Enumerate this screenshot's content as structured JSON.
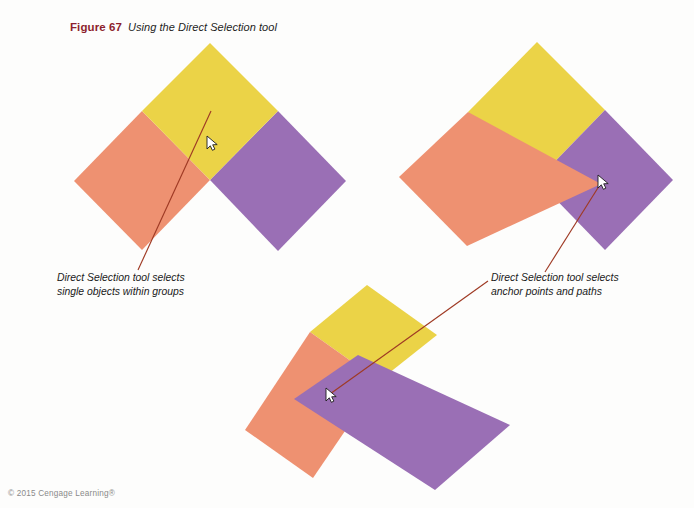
{
  "page": {
    "background_color": "#fdfdfc",
    "width": 694,
    "height": 508
  },
  "caption": {
    "figure_label": "Figure 67",
    "figure_title": "Using the Direct Selection tool",
    "label_color": "#8d1f2d"
  },
  "annotations": {
    "left": {
      "line1": "Direct Selection tool selects",
      "line2": "single objects within groups",
      "leader_color": "#9f3a24"
    },
    "right": {
      "line1": "Direct Selection tool selects",
      "line2": "anchor points and paths",
      "leader_color": "#9f3a24"
    }
  },
  "footer": {
    "copyright": "© 2015 Cengage Learning®"
  },
  "palette": {
    "yellow": "#ebd347",
    "salmon": "#ee9171",
    "purple": "#9a6fb5",
    "leader_red": "#9f3a24",
    "caption_red": "#8d1f2d"
  },
  "illustration": {
    "type": "vector-shape-diagram",
    "groups": [
      {
        "name": "group-top-left",
        "description": "Three rotated squares in original grouped arrangement",
        "shapes": [
          {
            "name": "yellow-square",
            "color": "#ebd347",
            "points": "210,43 278,111 210,180 142,111"
          },
          {
            "name": "salmon-square",
            "color": "#ee9171",
            "points": "142,111 210,180 142,250 74,181"
          },
          {
            "name": "purple-square",
            "color": "#9a6fb5",
            "points": "278,111 346,181 278,251 210,180"
          }
        ],
        "cursor": {
          "name": "direct-selection-cursor",
          "x": 210,
          "y": 143
        }
      },
      {
        "name": "group-top-right",
        "description": "Salmon square reshaped by dragging its right anchor point",
        "shapes": [
          {
            "name": "yellow-square",
            "color": "#ebd347",
            "points": "537,42 605,110 537,180 468,112"
          },
          {
            "name": "purple-square",
            "color": "#9a6fb5",
            "points": "605,110 673,180 605,250 537,180"
          },
          {
            "name": "salmon-reshaped",
            "color": "#ee9171",
            "points": "468,112 601,184 467,246 399,177"
          }
        ],
        "cursor": {
          "name": "direct-selection-cursor",
          "x": 601,
          "y": 182
        }
      },
      {
        "name": "group-bottom",
        "description": "Purple square reshaped, overlapping yellow and salmon squares",
        "shapes": [
          {
            "name": "yellow-square",
            "color": "#ebd347",
            "points": "367,285 437,335 379,381 310,332"
          },
          {
            "name": "salmon-square",
            "color": "#ee9171",
            "points": "310,332 379,381 313,478 245,430"
          },
          {
            "name": "purple-reshaped",
            "color": "#9a6fb5",
            "points": "358,355 510,425 435,490 294,399"
          }
        ],
        "cursor": {
          "name": "direct-selection-cursor",
          "x": 330,
          "y": 394
        }
      }
    ],
    "leader_lines": [
      {
        "name": "leader-left",
        "from": [
          211,
          111
        ],
        "to": [
          138,
          270
        ]
      },
      {
        "name": "leader-right",
        "from": [
          601,
          182
        ],
        "to": [
          545,
          272
        ]
      },
      {
        "name": "leader-bottom",
        "from": [
          330,
          394
        ],
        "to": [
          488,
          281
        ]
      }
    ]
  }
}
